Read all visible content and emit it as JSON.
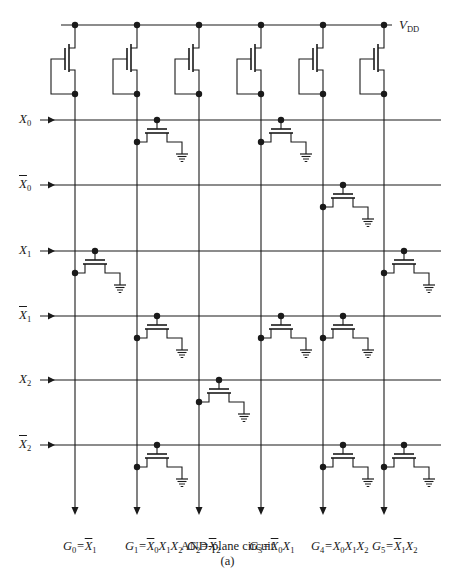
{
  "figure": {
    "caption_title": "AND-plane circuit",
    "caption_sub": "(a)",
    "supply_label": "V",
    "supply_sub": "DD",
    "colors": {
      "wire": "#1a1a1a",
      "background": "#ffffff"
    }
  },
  "inputs": [
    {
      "name": "X",
      "sub": "0",
      "bar": false,
      "y": 120
    },
    {
      "name": "X",
      "sub": "0",
      "bar": true,
      "y": 185
    },
    {
      "name": "X",
      "sub": "1",
      "bar": false,
      "y": 251
    },
    {
      "name": "X",
      "sub": "1",
      "bar": true,
      "y": 316
    },
    {
      "name": "X",
      "sub": "2",
      "bar": false,
      "y": 380
    },
    {
      "name": "X",
      "sub": "2",
      "bar": true,
      "y": 445
    }
  ],
  "columns": [
    75,
    137,
    199,
    261,
    323,
    384
  ],
  "outputs": [
    {
      "lhs": "G",
      "lhs_sub": "0",
      "terms": [
        {
          "sub": "1",
          "bar": true
        }
      ]
    },
    {
      "lhs": "G",
      "lhs_sub": "1",
      "terms": [
        {
          "sub": "0",
          "bar": true
        },
        {
          "sub": "1",
          "bar": false
        },
        {
          "sub": "2",
          "bar": false
        }
      ]
    },
    {
      "lhs": "G",
      "lhs_sub": "2",
      "terms": [
        {
          "sub": "2",
          "bar": true
        }
      ]
    },
    {
      "lhs": "G",
      "lhs_sub": "3",
      "terms": [
        {
          "sub": "0",
          "bar": true
        },
        {
          "sub": "1",
          "bar": false
        }
      ]
    },
    {
      "lhs": "G",
      "lhs_sub": "4",
      "terms": [
        {
          "sub": "0",
          "bar": false
        },
        {
          "sub": "1",
          "bar": false
        },
        {
          "sub": "2",
          "bar": false
        }
      ]
    },
    {
      "lhs": "G",
      "lhs_sub": "5",
      "terms": [
        {
          "sub": "1",
          "bar": true
        },
        {
          "sub": "2",
          "bar": false
        }
      ]
    }
  ],
  "output_labels_text": [
    "G0 = X̄1",
    "G1 = X̄0 X1 X2",
    "G2 = X̄2",
    "G3 = X̄0 X1",
    "G4 = X0 X1 X2",
    "G5 = X̄1 X2"
  ],
  "pulldown_transistors": [
    {
      "row": 0,
      "col": 1
    },
    {
      "row": 0,
      "col": 3
    },
    {
      "row": 1,
      "col": 4
    },
    {
      "row": 2,
      "col": 0
    },
    {
      "row": 2,
      "col": 5
    },
    {
      "row": 3,
      "col": 1
    },
    {
      "row": 3,
      "col": 3
    },
    {
      "row": 3,
      "col": 4
    },
    {
      "row": 4,
      "col": 2
    },
    {
      "row": 5,
      "col": 1
    },
    {
      "row": 5,
      "col": 4
    },
    {
      "row": 5,
      "col": 5
    }
  ],
  "geometry": {
    "vdd_y": 25,
    "vdd_x0": 61,
    "vdd_x1": 392,
    "input_x0": 40,
    "input_arrow_x": 48,
    "line_x1": 441,
    "load_top": 40,
    "load_bottom": 94,
    "output_end_y": 515
  }
}
